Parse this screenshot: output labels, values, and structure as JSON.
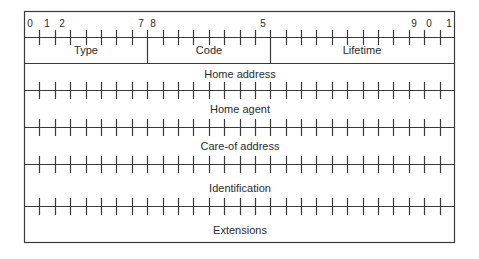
{
  "colors": {
    "line": "#3a3a3a",
    "text": "#2a2a2a",
    "background": "#ffffff"
  },
  "bit_labels": [
    {
      "text": "0",
      "bit": 0
    },
    {
      "text": "1",
      "bit": 1
    },
    {
      "text": "2",
      "bit": 2
    },
    {
      "text": "7",
      "bit": 7
    },
    {
      "text": "8",
      "bit": 8
    },
    {
      "text": "5",
      "bit": 15
    },
    {
      "text": "9",
      "bit": 29
    },
    {
      "text": "0",
      "bit": 30
    },
    {
      "text": "1",
      "bit": 31
    }
  ],
  "fields": {
    "type": "Type",
    "code": "Code",
    "lifetime": "Lifetime",
    "home_address": "Home address",
    "home_agent": "Home agent",
    "care_of_address": "Care-of address",
    "identification": "Identification",
    "extensions": "Extensions"
  }
}
